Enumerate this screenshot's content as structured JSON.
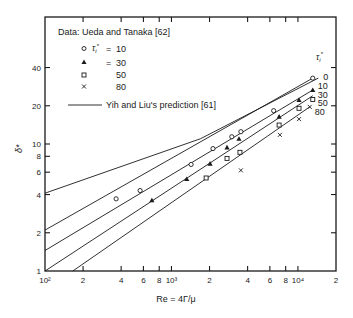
{
  "chart_data": {
    "type": "scatter",
    "title": "",
    "xlabel": "Re = 4Γ/μ",
    "ylabel": "δ*",
    "xscale": "log",
    "yscale": "log",
    "xlim": [
      100,
      20000
    ],
    "ylim": [
      1,
      100
    ],
    "x_ticks": [
      {
        "value": 100,
        "label": "10²"
      },
      {
        "value": 200,
        "label": "2"
      },
      {
        "value": 400,
        "label": "4"
      },
      {
        "value": 600,
        "label": "6"
      },
      {
        "value": 800,
        "label": "8"
      },
      {
        "value": 1000,
        "label": "10³"
      },
      {
        "value": 2000,
        "label": "2"
      },
      {
        "value": 4000,
        "label": "4"
      },
      {
        "value": 6000,
        "label": "6"
      },
      {
        "value": 8000,
        "label": "8"
      },
      {
        "value": 10000,
        "label": "10⁴"
      },
      {
        "value": 20000,
        "label": "2"
      }
    ],
    "y_ticks": [
      {
        "value": 1,
        "label": "1"
      },
      {
        "value": 2,
        "label": "2"
      },
      {
        "value": 4,
        "label": "4"
      },
      {
        "value": 6,
        "label": "6"
      },
      {
        "value": 8,
        "label": "8"
      },
      {
        "value": 10,
        "label": "10"
      },
      {
        "value": 20,
        "label": "20"
      },
      {
        "value": 40,
        "label": "40"
      }
    ],
    "grid": false,
    "legend": {
      "position": "upper-left",
      "header": "Data: Ueda and Tanaka [62]",
      "param_symbol": "τᵢ*",
      "entries": [
        {
          "marker": "circle-open",
          "label": "τᵢ* = 10"
        },
        {
          "marker": "triangle-filled",
          "label": "= 30"
        },
        {
          "marker": "square-open",
          "label": "50"
        },
        {
          "marker": "x",
          "label": "80"
        },
        {
          "marker": "line",
          "label": "Yih and Liu's prediction [61]"
        }
      ]
    },
    "line_label_header": "τᵢ*",
    "series": [
      {
        "name": "τᵢ* = 10 (data)",
        "marker": "circle-open",
        "x": [
          365,
          565,
          1430,
          2130,
          3000,
          3540,
          6430,
          13100
        ],
        "y": [
          3.7,
          4.3,
          6.9,
          9.2,
          11.4,
          12.5,
          18.3,
          33
        ]
      },
      {
        "name": "τᵢ* = 30 (data)",
        "marker": "triangle-filled",
        "x": [
          700,
          1320,
          2020,
          2750,
          3420,
          7100,
          10200,
          13100
        ],
        "y": [
          3.6,
          5.3,
          7.0,
          9.4,
          11.0,
          16.4,
          22.2,
          26.6
        ]
      },
      {
        "name": "τᵢ* = 50 (data)",
        "marker": "square-open",
        "x": [
          1880,
          2750,
          3480,
          7100,
          10200,
          13100
        ],
        "y": [
          5.4,
          7.7,
          8.6,
          14.1,
          19.1,
          22.4
        ]
      },
      {
        "name": "τᵢ* = 80 (data)",
        "marker": "x",
        "x": [
          3540,
          7200,
          10200,
          12400
        ],
        "y": [
          6.2,
          11.8,
          15.7,
          19.6
        ]
      }
    ],
    "prediction_lines": [
      {
        "label": "0",
        "x": [
          100,
          1700,
          14500
        ],
        "y": [
          4.1,
          11.0,
          33.0
        ]
      },
      {
        "label": "10",
        "x": [
          100,
          13100
        ],
        "y": [
          2.1,
          33.0
        ]
      },
      {
        "label": "30",
        "x": [
          100,
          13100
        ],
        "y": [
          1.45,
          26.6
        ]
      },
      {
        "label": "50",
        "x": [
          100,
          13100
        ],
        "y": [
          1.0,
          24.0
        ]
      },
      {
        "label": "80",
        "x": [
          166,
          12400
        ],
        "y": [
          1.0,
          19.6
        ]
      }
    ]
  }
}
